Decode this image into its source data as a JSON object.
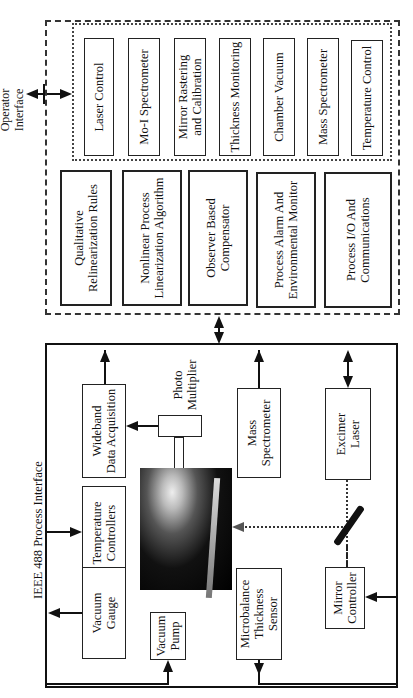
{
  "operator_interface": {
    "label_line1": "Operator",
    "label_line2": "Interface"
  },
  "software_modules": {
    "control_loops": [
      {
        "label": "Laser Control"
      },
      {
        "label": "Mo-I Spectrometer"
      },
      {
        "label_line1": "Mirror Rastering",
        "label_line2": "and Calibration"
      },
      {
        "label": "Thickness Monitoring"
      },
      {
        "label": "Chamber Vacuum"
      },
      {
        "label": "Mass Spectrometer"
      },
      {
        "label": "Temperature Control"
      }
    ],
    "supervisory": [
      {
        "label_line1": "Qualitative",
        "label_line2": "Relinearization Rules"
      },
      {
        "label_line1": "Nonlinear Process",
        "label_line2": "Linearization Algorithm"
      },
      {
        "label_line1": "Observer Based",
        "label_line2": "Compensator"
      },
      {
        "label_line1": "Process Alarm And",
        "label_line2": "Environmental  Monitor"
      },
      {
        "label_line1": "Process I/O And",
        "label_line2": "Communications"
      }
    ]
  },
  "hardware": {
    "bus_label": "IEEE 488 Process Interface",
    "wideband": {
      "line1": "Wideband",
      "line2": "Data Acquisition"
    },
    "photo_multiplier": {
      "line1": "Photo",
      "line2": "Multiplier"
    },
    "temperature_controllers": {
      "line1": "Temperature",
      "line2": "Controllers"
    },
    "vacuum_gauge": {
      "line1": "Vacuum",
      "line2": "Gauge"
    },
    "vacuum_pump": {
      "line1": "Vacuum",
      "line2": "Pump"
    },
    "mass_spectrometer": {
      "line1": "Mass",
      "line2": "Spectrometer"
    },
    "microbalance": {
      "line1": "Microbalance",
      "line2": "Thickness",
      "line3": "Sensor"
    },
    "excimer_laser": {
      "line1": "Excimer",
      "line2": "Laser"
    },
    "mirror_controller": {
      "line1": "Mirror",
      "line2": "Controller"
    },
    "chamber_image": "deposition-chamber-photo"
  }
}
